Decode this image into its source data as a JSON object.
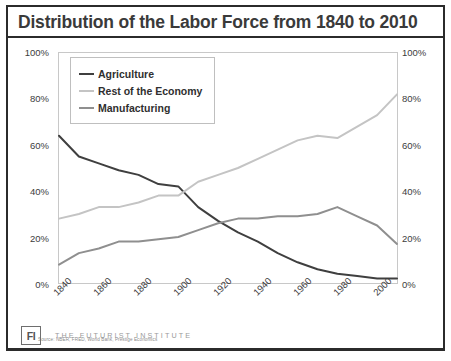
{
  "title": "Distribution of the Labor Force from 1840 to 2010",
  "source_note": "Source: NBER, FRED, World Bank, Prestige Economics",
  "footer": {
    "logo_text": "FI",
    "organization": "THE FUTURIST INSTITUTE"
  },
  "colors": {
    "agriculture": "#3f3f3f",
    "rest_of_economy": "#c4c4c4",
    "manufacturing": "#8f8f8f",
    "frame": "#2b2b2b",
    "plot_border": "#c8c8c8"
  },
  "chart_data": {
    "type": "line",
    "title": "Distribution of the Labor Force from 1840 to 2010",
    "xlabel": "",
    "ylabel": "",
    "xlim": [
      1840,
      2010
    ],
    "ylim": [
      0,
      100
    ],
    "grid": false,
    "legend_position": "top-left",
    "y_ticks": [
      "0%",
      "20%",
      "40%",
      "60%",
      "80%",
      "100%"
    ],
    "y_tick_values": [
      0,
      20,
      40,
      60,
      80,
      100
    ],
    "y_axis_right_mirrored": true,
    "x_ticks": [
      "1840",
      "1860",
      "1880",
      "1900",
      "1920",
      "1940",
      "1960",
      "1980",
      "2000"
    ],
    "x_tick_values": [
      1840,
      1860,
      1880,
      1900,
      1920,
      1940,
      1960,
      1980,
      2000
    ],
    "x": [
      1840,
      1850,
      1860,
      1870,
      1880,
      1890,
      1900,
      1910,
      1920,
      1930,
      1940,
      1950,
      1960,
      1970,
      1980,
      1990,
      2000,
      2010
    ],
    "series": [
      {
        "name": "Agriculture",
        "color": "#3f3f3f",
        "values": [
          64,
          55,
          52,
          49,
          47,
          43,
          42,
          33,
          27,
          22,
          18,
          13,
          9,
          6,
          4,
          3,
          2,
          2
        ]
      },
      {
        "name": "Rest of the Economy",
        "color": "#c4c4c4",
        "values": [
          28,
          30,
          33,
          33,
          35,
          38,
          38,
          44,
          47,
          50,
          54,
          58,
          62,
          64,
          63,
          68,
          73,
          82
        ]
      },
      {
        "name": "Manufacturing",
        "color": "#8f8f8f",
        "values": [
          8,
          13,
          15,
          18,
          18,
          19,
          20,
          23,
          26,
          28,
          28,
          29,
          29,
          30,
          33,
          29,
          25,
          17
        ]
      }
    ]
  }
}
